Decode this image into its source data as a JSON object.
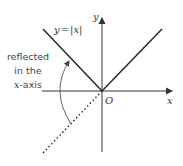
{
  "diagram": {
    "type": "graph-transformation",
    "function_label": "y = |x|",
    "function_label_parts": {
      "lhs": "y",
      "eq": "=",
      "rhs": "|x|"
    },
    "annotation": {
      "lines": [
        "reflected",
        "in the",
        "x-axis"
      ],
      "line3_var": "x",
      "line3_rest": "-axis"
    },
    "axes": {
      "x_label": "x",
      "y_label": "y",
      "origin_label": "O"
    },
    "colors": {
      "line": "#222222",
      "axis": "#333333",
      "text": "#444444",
      "arc": "#555555"
    }
  }
}
